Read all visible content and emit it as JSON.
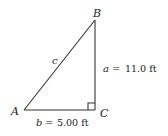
{
  "diagram": {
    "type": "right-triangle",
    "vertices": {
      "A": {
        "label": "A"
      },
      "B": {
        "label": "B"
      },
      "C": {
        "label": "C"
      }
    },
    "sides": {
      "a": {
        "var": "a",
        "eq": "=",
        "value": "11.0 ft"
      },
      "b": {
        "var": "b",
        "eq": "=",
        "value": "5.00 ft"
      },
      "c": {
        "var": "c"
      }
    },
    "right_angle_at": "C",
    "colors": {
      "line": "#333333",
      "text": "#222222"
    }
  }
}
